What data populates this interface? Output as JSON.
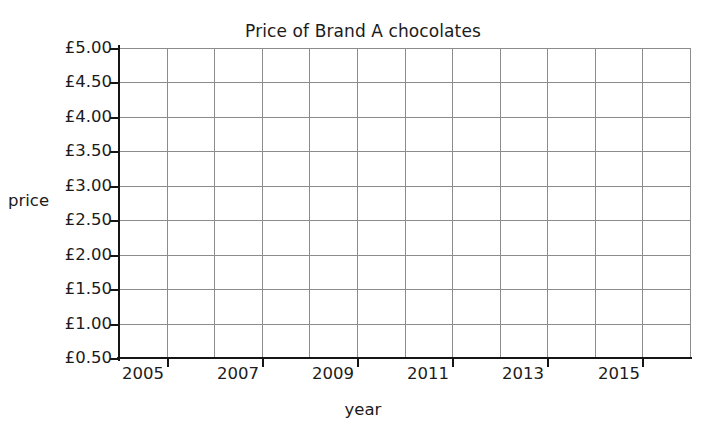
{
  "chart_data": {
    "type": "line",
    "title": "Price of Brand A chocolates",
    "xlabel": "year",
    "ylabel": "price",
    "grid": true,
    "legend": "none",
    "series": [
      {
        "name": "Price of Brand A chocolates",
        "x": [],
        "values": []
      }
    ],
    "x": [],
    "categories": [],
    "values": [],
    "xlim": [
      2004,
      2016
    ],
    "ylim": [
      0.5,
      5.0
    ],
    "y_tick_labels": [
      "£5.00",
      "£4.50",
      "£4.00",
      "£3.50",
      "£3.00",
      "£2.50",
      "£2.00",
      "£1.50",
      "£1.00",
      "£0.50"
    ],
    "y_tick_values": [
      5.0,
      4.5,
      4.0,
      3.5,
      3.0,
      2.5,
      2.0,
      1.5,
      1.0,
      0.5
    ],
    "x_tick_labels": [
      "2005",
      "2007",
      "2009",
      "2011",
      "2013",
      "2015"
    ],
    "x_tick_values": [
      2005,
      2007,
      2009,
      2011,
      2013,
      2015
    ],
    "x_minor_divisions": 12,
    "annotations": [],
    "data_points": "none — blank grid for plotting",
    "colors": {
      "gridline": "#8c8c8c",
      "axis": "#151515",
      "text": "#1b1b1b",
      "background": "#ffffff"
    }
  }
}
